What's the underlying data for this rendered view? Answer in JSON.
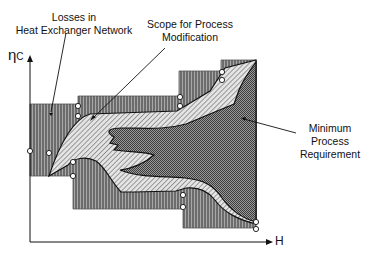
{
  "diagram": {
    "labels": {
      "losses_line1": "Losses in",
      "losses_line2": "Heat Exchanger Network",
      "scope_line1": "Scope for Process",
      "scope_line2": "Modification",
      "min_line1": "Minimum",
      "min_line2": "Process",
      "min_line3": "Requirement"
    },
    "axes": {
      "y_label": "η",
      "y_label_sub": "C",
      "x_label": "H"
    },
    "regions": [
      {
        "name": "Losses in Heat Exchanger Network",
        "pattern": "vertical-hatch",
        "color": "#777777"
      },
      {
        "name": "Scope for Process Modification",
        "pattern": "diagonal-hatch",
        "color": "#bbbbbb"
      },
      {
        "name": "Minimum Process Requirement",
        "pattern": "dotted-dark",
        "color": "#6e6e6e"
      }
    ]
  }
}
